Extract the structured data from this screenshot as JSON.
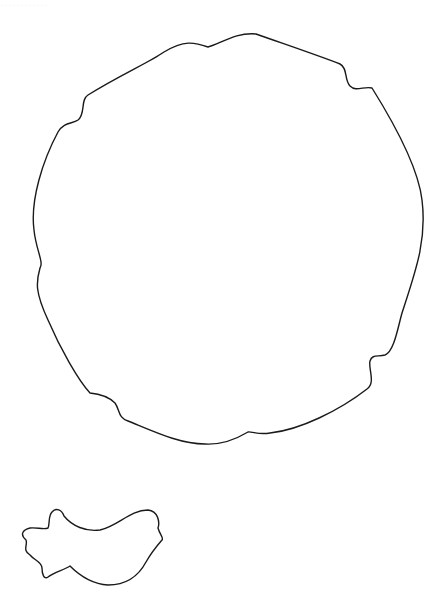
{
  "header": {
    "faint_label": "············"
  },
  "shapes": [
    {
      "name": "large-rounded-blob",
      "stroke": "#1a1a1a",
      "fill": "#ffffff"
    },
    {
      "name": "small-bird-blob",
      "stroke": "#1a1a1a",
      "fill": "#ffffff"
    }
  ]
}
